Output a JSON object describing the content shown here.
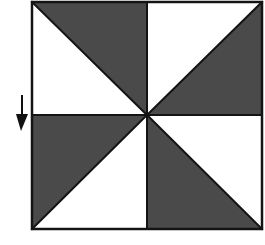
{
  "figure": {
    "name": "pinwheel-square-diagram",
    "caption": "",
    "canvas": {
      "width": 265,
      "height": 245,
      "background": "#ffffff"
    },
    "colors": {
      "shaded": "#4a4a4a",
      "unshaded": "#ffffff",
      "outline": "#141414",
      "arrow": "#111111"
    },
    "square": {
      "label": "outer-square",
      "x": 32,
      "y": 2,
      "width": 230,
      "height": 227,
      "stroke_width": 2.5,
      "center_x": 147,
      "center_y": 115
    },
    "quadrants": [
      {
        "id": "top-left",
        "label": "Top-left quadrant",
        "bounds": {
          "x": 32,
          "y": 2,
          "width": 115,
          "height": 113
        },
        "diagonal": "top-left-to-bottom-right",
        "shaded_half": "upper-right",
        "shaded_points": "32,2 147,2 147,115",
        "fill": "#4a4a4a"
      },
      {
        "id": "top-right",
        "label": "Top-right quadrant",
        "bounds": {
          "x": 147,
          "y": 2,
          "width": 115,
          "height": 113
        },
        "diagonal": "top-right-to-bottom-left",
        "shaded_half": "lower-right",
        "shaded_points": "262,2 262,115 147,115",
        "fill": "#4a4a4a"
      },
      {
        "id": "bottom-left",
        "label": "Bottom-left quadrant",
        "bounds": {
          "x": 32,
          "y": 115,
          "width": 115,
          "height": 114
        },
        "diagonal": "bottom-left-to-top-right",
        "shaded_half": "upper-left",
        "shaded_points": "32,115 147,115 32,229",
        "fill": "#4a4a4a"
      },
      {
        "id": "bottom-right",
        "label": "Bottom-right quadrant",
        "bounds": {
          "x": 147,
          "y": 115,
          "width": 115,
          "height": 114
        },
        "diagonal": "top-left-to-bottom-right",
        "shaded_half": "lower-left",
        "shaded_points": "147,115 262,229 147,229",
        "fill": "#4a4a4a"
      }
    ],
    "internal_lines": [
      {
        "id": "vertical-midline",
        "x1": 147,
        "y1": 2,
        "x2": 147,
        "y2": 229
      },
      {
        "id": "horizontal-midline",
        "x1": 32,
        "y1": 115,
        "x2": 262,
        "y2": 115
      },
      {
        "id": "diagonal-top-left",
        "x1": 32,
        "y1": 2,
        "x2": 147,
        "y2": 115
      },
      {
        "id": "diagonal-top-right",
        "x1": 262,
        "y1": 2,
        "x2": 147,
        "y2": 115
      },
      {
        "id": "diagonal-bottom-left",
        "x1": 32,
        "y1": 229,
        "x2": 147,
        "y2": 115
      },
      {
        "id": "diagonal-bottom-right",
        "x1": 262,
        "y1": 229,
        "x2": 147,
        "y2": 115
      }
    ],
    "arrow": {
      "id": "left-pointer-arrow",
      "label": "Downward arrow marker at left of square",
      "direction": "down",
      "shaft": {
        "x1": 22,
        "y1": 95,
        "x2": 22,
        "y2": 117
      },
      "shaft_width": 2,
      "head_points": "16,114 28,114 21,131",
      "color": "#111111"
    }
  }
}
